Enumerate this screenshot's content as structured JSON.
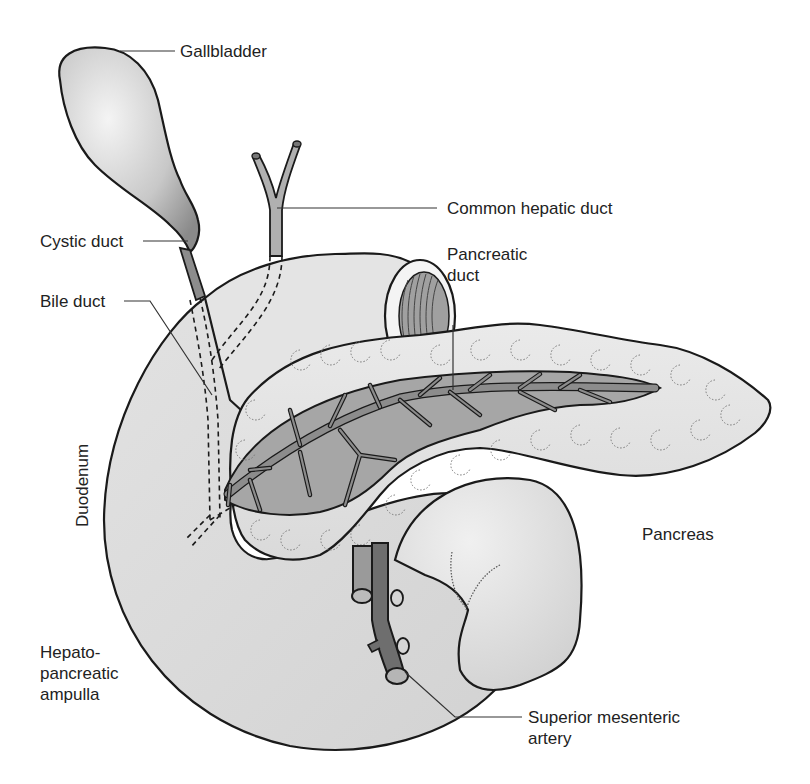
{
  "figure": {
    "type": "anatomical-illustration",
    "colors": {
      "background": "#ffffff",
      "organ_fill": "#e6e6e6",
      "organ_fill_light": "#f2f2f2",
      "duct_fill": "#8c8c8c",
      "duct_dark": "#6e6e6e",
      "interior_fill": "#a8a8a8",
      "outline": "#1a1a1a",
      "leader_line": "#333333",
      "label_text": "#222222"
    },
    "labels": {
      "gallbladder": "Gallbladder",
      "common_hepatic_duct": "Common hepatic duct",
      "cystic_duct": "Cystic duct",
      "pancreatic_duct": "Pancreatic\nduct",
      "bile_duct": "Bile duct",
      "duodenum": "Duodenum",
      "pancreas": "Pancreas",
      "hepatopancreatic_ampulla": "Hepato-\npancreatic\nampulla",
      "superior_mesenteric_artery": "Superior mesenteric\nartery"
    },
    "caption": ""
  }
}
